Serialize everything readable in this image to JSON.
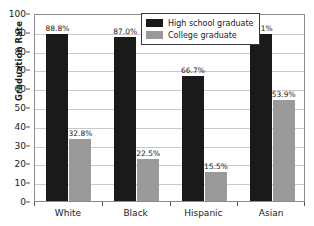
{
  "chart_data": {
    "type": "bar",
    "title": "",
    "xlabel": "",
    "ylabel": "Graduation Rate",
    "ylim": [
      0,
      100
    ],
    "ytick_step": 10,
    "yticks": [
      100,
      90,
      80,
      70,
      60,
      50,
      40,
      30,
      20,
      10,
      0
    ],
    "grid": true,
    "legend_position": "top-center",
    "categories": [
      "White",
      "Black",
      "Hispanic",
      "Asian"
    ],
    "series": [
      {
        "name": "High school graduate",
        "color": "#1a1a1a",
        "values": [
          88.8,
          87.0,
          66.7,
          89.1
        ],
        "labels": [
          "88.8%",
          "87.0%",
          "66.7%",
          "89.1%"
        ]
      },
      {
        "name": "College graduate",
        "color": "#9a9a9a",
        "values": [
          32.8,
          22.5,
          15.5,
          53.9
        ],
        "labels": [
          "32.8%",
          "22.5%",
          "15.5%",
          "53.9%"
        ]
      }
    ]
  },
  "axis": {
    "y_title": "Graduation Rate",
    "y_tick_labels": [
      "100",
      "90",
      "80",
      "70",
      "60",
      "50",
      "40",
      "30",
      "20",
      "10",
      "0"
    ],
    "x_tick_labels": [
      "White",
      "Black",
      "Hispanic",
      "Asian"
    ]
  },
  "legend": {
    "items": [
      {
        "label": "High school graduate",
        "swatch": "hs"
      },
      {
        "label": "College graduate",
        "swatch": "col"
      }
    ]
  },
  "title": {
    "text": ""
  },
  "colors": {
    "high_school": "#1a1a1a",
    "college": "#9a9a9a",
    "gridline": "#c9c9c9",
    "frame": "#8c8c8c",
    "background": "#ffffff"
  }
}
